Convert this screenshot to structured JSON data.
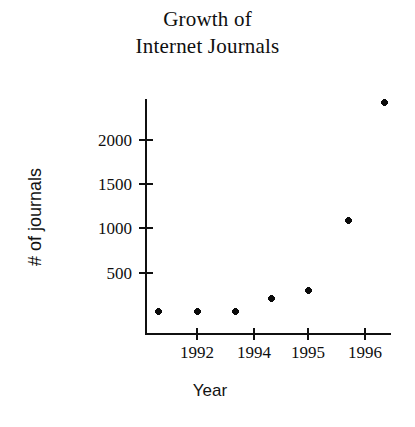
{
  "chart_data": {
    "type": "scatter",
    "title": "Growth of Internet Journals",
    "title_lines": [
      "Growth of",
      "Internet Journals"
    ],
    "xlabel": "Year",
    "ylabel": "# of journals",
    "grid": false,
    "legend": null,
    "x_tick_labels": [
      "1992",
      "1994",
      "1995",
      "1996"
    ],
    "x_tick_values": [
      1992,
      1994,
      1995,
      1996
    ],
    "y_tick_labels": [
      "500",
      "1000",
      "1500",
      "2000"
    ],
    "y_tick_values": [
      500,
      1000,
      1500,
      2000
    ],
    "ylim": [
      0,
      2550
    ],
    "xlim": [
      1990.8,
      1996.9
    ],
    "marker": "diamond-plus",
    "marker_color": "#0b0b0b",
    "points": [
      {
        "x": 1991.0,
        "y": 30
      },
      {
        "x": 1992.0,
        "y": 30
      },
      {
        "x": 1993.0,
        "y": 30
      },
      {
        "x": 1993.9,
        "y": 200
      },
      {
        "x": 1994.9,
        "y": 290
      },
      {
        "x": 1995.9,
        "y": 1080
      },
      {
        "x": 1996.5,
        "y": 2400
      }
    ],
    "x_px": [
      158,
      197,
      235,
      271,
      308,
      348,
      384
    ],
    "y_px": [
      311,
      311,
      311,
      298,
      290,
      220,
      102
    ],
    "x_tick_px": [
      197,
      254,
      308,
      365
    ],
    "y_tick_px": [
      272,
      227,
      183,
      139
    ]
  },
  "axes": {
    "y_axis_top_px": 99,
    "y_axis_bottom_px": 335,
    "x_axis_y_px": 333,
    "x_axis_left_px": 146,
    "x_axis_right_px": 391
  },
  "colors": {
    "background": "#ffffff",
    "ink": "#101010",
    "marker": "#0b0b0b"
  }
}
